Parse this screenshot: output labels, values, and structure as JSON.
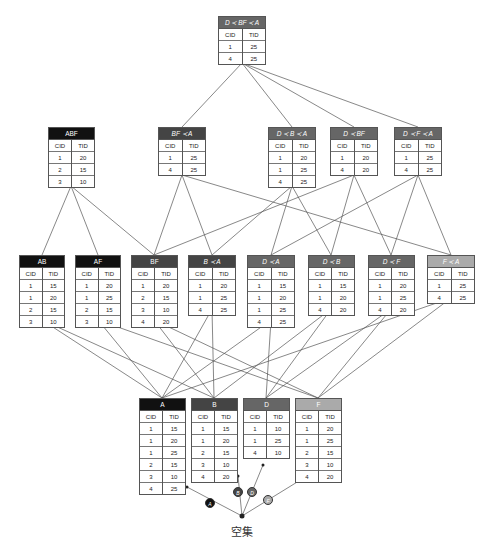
{
  "colors": {
    "black": "#111111",
    "dark": "#444444",
    "mid": "#666666",
    "light": "#aaaaaa",
    "edge": "#555555"
  },
  "columns": [
    "CID",
    "TID"
  ],
  "nodes": {
    "top": {
      "label": "D ≺ BF ≺ A",
      "shade": "mid",
      "rows": [
        [
          "1",
          "25"
        ],
        [
          "4",
          "25"
        ]
      ]
    },
    "ABF": {
      "label": "ABF",
      "shade": "black",
      "rows": [
        [
          "1",
          "20"
        ],
        [
          "2",
          "15"
        ],
        [
          "3",
          "10"
        ]
      ]
    },
    "BFA": {
      "label": "BF ≺ A",
      "shade": "dark",
      "rows": [
        [
          "1",
          "25"
        ],
        [
          "4",
          "25"
        ]
      ]
    },
    "DBA": {
      "label": "D ≺ B ≺ A",
      "shade": "mid",
      "rows": [
        [
          "1",
          "20"
        ],
        [
          "1",
          "25"
        ],
        [
          "4",
          "25"
        ]
      ]
    },
    "DBF": {
      "label": "D ≺ BF",
      "shade": "mid",
      "rows": [
        [
          "1",
          "20"
        ],
        [
          "4",
          "20"
        ]
      ]
    },
    "DFA": {
      "label": "D ≺ F ≺ A",
      "shade": "mid",
      "rows": [
        [
          "1",
          "25"
        ],
        [
          "4",
          "25"
        ]
      ]
    },
    "AB": {
      "label": "AB",
      "shade": "black",
      "rows": [
        [
          "1",
          "15"
        ],
        [
          "1",
          "20"
        ],
        [
          "2",
          "15"
        ],
        [
          "3",
          "10"
        ]
      ]
    },
    "AF": {
      "label": "AF",
      "shade": "black",
      "rows": [
        [
          "1",
          "20"
        ],
        [
          "1",
          "25"
        ],
        [
          "2",
          "15"
        ],
        [
          "3",
          "10"
        ]
      ]
    },
    "BF": {
      "label": "BF",
      "shade": "dark",
      "rows": [
        [
          "1",
          "20"
        ],
        [
          "2",
          "15"
        ],
        [
          "3",
          "10"
        ],
        [
          "4",
          "20"
        ]
      ]
    },
    "BA": {
      "label": "B ≺ A",
      "shade": "dark",
      "rows": [
        [
          "1",
          "20"
        ],
        [
          "1",
          "25"
        ],
        [
          "4",
          "25"
        ]
      ]
    },
    "DA": {
      "label": "D ≺ A",
      "shade": "mid",
      "rows": [
        [
          "1",
          "15"
        ],
        [
          "1",
          "20"
        ],
        [
          "1",
          "25"
        ],
        [
          "4",
          "25"
        ]
      ]
    },
    "DB": {
      "label": "D ≺ B",
      "shade": "mid",
      "rows": [
        [
          "1",
          "15"
        ],
        [
          "1",
          "20"
        ],
        [
          "4",
          "20"
        ]
      ]
    },
    "DF": {
      "label": "D ≺ F",
      "shade": "mid",
      "rows": [
        [
          "1",
          "20"
        ],
        [
          "1",
          "25"
        ],
        [
          "4",
          "20"
        ]
      ]
    },
    "FA": {
      "label": "F ≺ A",
      "shade": "light",
      "rows": [
        [
          "1",
          "25"
        ],
        [
          "4",
          "25"
        ]
      ]
    },
    "A": {
      "label": "A",
      "shade": "black",
      "rows": [
        [
          "1",
          "15"
        ],
        [
          "1",
          "20"
        ],
        [
          "1",
          "25"
        ],
        [
          "2",
          "15"
        ],
        [
          "3",
          "10"
        ],
        [
          "4",
          "25"
        ]
      ]
    },
    "B": {
      "label": "B",
      "shade": "dark",
      "rows": [
        [
          "1",
          "15"
        ],
        [
          "1",
          "20"
        ],
        [
          "2",
          "15"
        ],
        [
          "3",
          "10"
        ],
        [
          "4",
          "20"
        ]
      ]
    },
    "C": {
      "label": "D",
      "shade": "mid",
      "rows": [
        [
          "1",
          "10"
        ],
        [
          "1",
          "25"
        ],
        [
          "4",
          "10"
        ]
      ]
    },
    "F": {
      "label": "F",
      "shade": "light",
      "rows": [
        [
          "1",
          "20"
        ],
        [
          "1",
          "25"
        ],
        [
          "2",
          "15"
        ],
        [
          "3",
          "10"
        ],
        [
          "4",
          "20"
        ]
      ]
    }
  },
  "root": {
    "label": "空集"
  },
  "badges": [
    {
      "label": "A",
      "shade": "black"
    },
    {
      "label": "B",
      "shade": "dark"
    },
    {
      "label": "D",
      "shade": "mid"
    },
    {
      "label": "F",
      "shade": "light"
    }
  ]
}
